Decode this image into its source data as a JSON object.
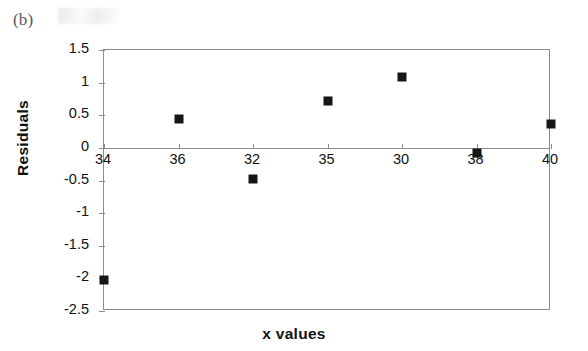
{
  "panel": {
    "label": "(b)"
  },
  "chart_data": {
    "type": "scatter",
    "title": "",
    "xlabel": "x values",
    "ylabel": "Residuals",
    "categories": [
      "34",
      "36",
      "32",
      "35",
      "30",
      "38",
      "40"
    ],
    "values": [
      -2.02,
      0.45,
      -0.47,
      0.72,
      1.09,
      -0.08,
      0.36
    ],
    "points": [
      {
        "x": "34",
        "y": -2.02
      },
      {
        "x": "36",
        "y": 0.45
      },
      {
        "x": "32",
        "y": -0.47
      },
      {
        "x": "35",
        "y": 0.72
      },
      {
        "x": "30",
        "y": 1.09
      },
      {
        "x": "38",
        "y": -0.08
      },
      {
        "x": "40",
        "y": 0.36
      }
    ],
    "ylim": [
      -2.5,
      1.5
    ],
    "ytick_labels": [
      "1.5",
      "1",
      "0.5",
      "0",
      "-0.5",
      "-1",
      "-1.5",
      "-2",
      "-2.5"
    ],
    "ytick_values": [
      1.5,
      1,
      0.5,
      0,
      -0.5,
      -1,
      -1.5,
      -2,
      -2.5
    ],
    "grid": false,
    "legend": false,
    "legend_position": "none",
    "marker_shape": "square",
    "marker_color": "#161616",
    "axis_color": "#8c8c8c",
    "background_color": "#ffffff"
  }
}
